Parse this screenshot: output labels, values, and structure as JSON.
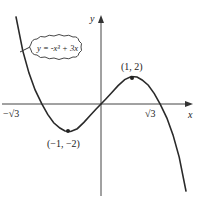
{
  "diagram": {
    "equation_label": "y = -x³ + 3x",
    "axes": {
      "x_label": "x",
      "y_label": "y"
    },
    "x_intercepts": [
      {
        "label": "−√3",
        "x": -1.732
      },
      {
        "label": "√3",
        "x": 1.732
      }
    ],
    "points": [
      {
        "label": "(1, 2)",
        "x": 1,
        "y": 2,
        "type": "local-max"
      },
      {
        "label": "(−1, −2)",
        "x": -1,
        "y": -2,
        "type": "local-min"
      }
    ],
    "colors": {
      "curve": "#2a2a2a",
      "axes": "#444444",
      "background": "#ffffff"
    }
  }
}
